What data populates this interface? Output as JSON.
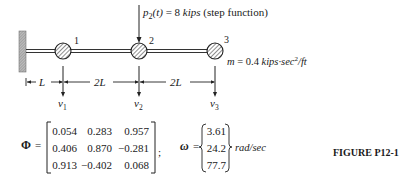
{
  "load": {
    "symbol": "p",
    "subscript": "2",
    "arg": "(t)",
    "equals": "= 8",
    "unit": "kips",
    "note": "(step function)"
  },
  "masses": [
    {
      "label": "1",
      "dof": "v",
      "dof_sub": "1"
    },
    {
      "label": "2",
      "dof": "v",
      "dof_sub": "2"
    },
    {
      "label": "3",
      "dof": "v",
      "dof_sub": "3"
    }
  ],
  "mass_value": {
    "symbol": "m",
    "equals": "= 0.4",
    "unit_a": "kips·sec",
    "unit_exp": "2",
    "unit_b": "/ft"
  },
  "dimensions": [
    "L",
    "2L",
    "2L"
  ],
  "phi": {
    "symbol": "Φ",
    "equals": "=",
    "rows": [
      [
        "0.054",
        "0.283",
        "0.957"
      ],
      [
        "0.406",
        "0.870",
        "−0.281"
      ],
      [
        "0.913",
        "−0.402",
        "0.068"
      ]
    ],
    "separator": ";"
  },
  "omega": {
    "symbol": "ω",
    "equals": "=",
    "values": [
      "3.61",
      "24.2",
      "77.7"
    ],
    "unit": "rad/sec"
  },
  "caption": "FIGURE P12-1"
}
